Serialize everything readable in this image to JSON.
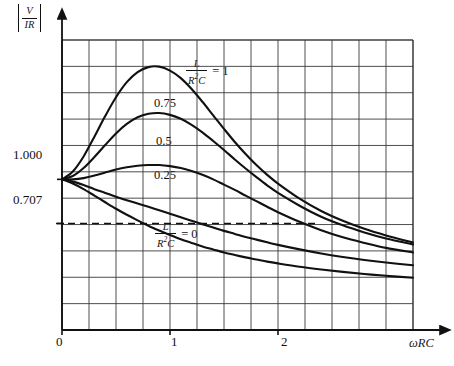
{
  "chart_data": {
    "type": "line",
    "title": "",
    "xlabel": "ωRC",
    "ylabel": "|V/IR|",
    "ylabel_parts": {
      "numerator": "V",
      "denominator": "IR"
    },
    "xlabel_parts": {
      "omega": "ω",
      "rc": "RC"
    },
    "xlim": [
      0,
      3.25
    ],
    "ylim": [
      0.0,
      1.925
    ],
    "grid": true,
    "grid_x_step": 0.25,
    "grid_y_step": 0.175,
    "x_ticks": [
      {
        "value": 0,
        "label": "0"
      },
      {
        "value": 1,
        "label": "1"
      },
      {
        "value": 2,
        "label": "2"
      }
    ],
    "y_ticks": [
      {
        "value": 1.0,
        "label": "1.000"
      },
      {
        "value": 0.707,
        "label": "0.707",
        "dashed_reference": true
      }
    ],
    "legend_position": "inline-annotations",
    "parameter_name": "L/(R²C)",
    "annotations": [
      {
        "text": "= 1",
        "param": "1",
        "x": 1.27,
        "y": 1.58,
        "kind": "fraction-equals"
      },
      {
        "text": "0.75",
        "param": "0.75",
        "x": 0.92,
        "y": 1.37,
        "kind": "plain"
      },
      {
        "text": "0.5",
        "param": "0.5",
        "x": 0.92,
        "y": 1.13,
        "kind": "plain"
      },
      {
        "text": "0.25",
        "param": "0.25",
        "x": 0.92,
        "y": 0.97,
        "kind": "plain"
      },
      {
        "text": "= 0",
        "param": "0",
        "x": 0.92,
        "y": 0.655,
        "kind": "fraction-equals"
      }
    ],
    "x": [
      0,
      0.1,
      0.2,
      0.3,
      0.4,
      0.5,
      0.6,
      0.7,
      0.8,
      0.9,
      1.0,
      1.1,
      1.2,
      1.3,
      1.4,
      1.5,
      1.6,
      1.7,
      1.8,
      1.9,
      2.0,
      2.2,
      2.4,
      2.6,
      2.8,
      3.0,
      3.25
    ],
    "series": [
      {
        "name": "L/(R²C) = 1",
        "label": "1",
        "color": "#111111",
        "values": [
          1.0,
          1.052,
          1.152,
          1.283,
          1.42,
          1.545,
          1.645,
          1.712,
          1.745,
          1.748,
          1.722,
          1.672,
          1.6,
          1.515,
          1.425,
          1.335,
          1.248,
          1.168,
          1.095,
          1.03,
          0.972,
          0.872,
          0.79,
          0.725,
          0.672,
          0.628,
          0.58
        ]
      },
      {
        "name": "L/(R²C) = 0.75",
        "label": "0.75",
        "color": "#111111",
        "values": [
          1.0,
          1.022,
          1.075,
          1.148,
          1.228,
          1.305,
          1.368,
          1.412,
          1.435,
          1.44,
          1.428,
          1.402,
          1.362,
          1.312,
          1.255,
          1.195,
          1.132,
          1.072,
          1.015,
          0.96,
          0.91,
          0.825,
          0.752,
          0.695,
          0.648,
          0.608,
          0.568
        ]
      },
      {
        "name": "L/(R²C) = 0.5",
        "label": "0.5",
        "color": "#111111",
        "values": [
          1.0,
          1.0,
          1.008,
          1.025,
          1.045,
          1.065,
          1.08,
          1.09,
          1.095,
          1.095,
          1.088,
          1.075,
          1.055,
          1.03,
          1.0,
          0.965,
          0.93,
          0.892,
          0.855,
          0.818,
          0.782,
          0.718,
          0.662,
          0.615,
          0.578,
          0.545,
          0.515
        ]
      },
      {
        "name": "L/(R²C) = 0.25",
        "label": "0.25",
        "color": "#111111",
        "values": [
          1.0,
          0.985,
          0.962,
          0.935,
          0.91,
          0.885,
          0.862,
          0.84,
          0.818,
          0.795,
          0.772,
          0.748,
          0.725,
          0.702,
          0.68,
          0.658,
          0.638,
          0.618,
          0.6,
          0.582,
          0.565,
          0.535,
          0.508,
          0.485,
          0.465,
          0.448,
          0.43
        ]
      },
      {
        "name": "L/(R²C) = 0",
        "label": "0",
        "color": "#111111",
        "values": [
          1.0,
          0.972,
          0.935,
          0.892,
          0.848,
          0.805,
          0.765,
          0.728,
          0.692,
          0.66,
          0.63,
          0.602,
          0.578,
          0.555,
          0.535,
          0.515,
          0.498,
          0.482,
          0.468,
          0.454,
          0.442,
          0.42,
          0.402,
          0.386,
          0.372,
          0.36,
          0.347
        ]
      }
    ]
  },
  "figure": {
    "y_axis_label_numerator": "V",
    "y_axis_label_denominator": "IR",
    "x_axis_label_omega": "ω",
    "x_axis_label_rc": "RC",
    "tick_0": "0",
    "tick_1": "1",
    "tick_2": "2",
    "tick_1000": "1.000",
    "tick_0707": "0.707",
    "label_075": "0.75",
    "label_05": "0.5",
    "label_025": "0.25",
    "frac_numerator": "L",
    "frac_denominator_base": "R",
    "frac_denominator_exp": "2",
    "frac_denominator_tail": "C",
    "eq_one": "= 1",
    "eq_zero": "= 0"
  }
}
